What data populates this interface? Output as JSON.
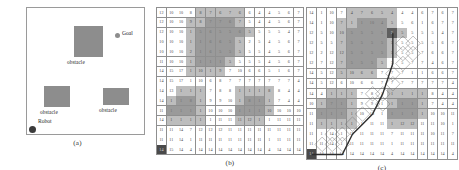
{
  "figure": {
    "panels": [
      {
        "id": "a",
        "caption": "(a)"
      },
      {
        "id": "b",
        "caption": "(b)"
      },
      {
        "id": "c",
        "caption": "(c)"
      }
    ]
  },
  "panel_a": {
    "obstacle_label": "obstacle",
    "goal_label": "Goal",
    "robot_label": "Robot",
    "obstacle_color": "#8d8d8d",
    "robot_color": "#3b3b3b",
    "border_color": "#9a9a9a",
    "obstacles": [
      {
        "name": "obstacle-top",
        "x": 47,
        "y": 18,
        "w": 29,
        "h": 31,
        "label": "obstacle",
        "label_x": 40,
        "label_y": 51
      },
      {
        "name": "obstacle-lower-left",
        "x": 17,
        "y": 78,
        "w": 26,
        "h": 21,
        "label": "obstacle",
        "label_x": 13,
        "label_y": 101
      },
      {
        "name": "obstacle-lower-left-notch",
        "x": 17,
        "y": 85,
        "w": 13,
        "h": 14,
        "label": "",
        "label_x": 0,
        "label_y": 0
      },
      {
        "name": "obstacle-right",
        "x": 76,
        "y": 80,
        "w": 26,
        "h": 17,
        "label": "obstacle",
        "label_x": 72,
        "label_y": 99
      }
    ],
    "goal": {
      "x": 88,
      "y": 25,
      "label_x": 95,
      "label_y": 22
    },
    "robot": {
      "x": 2,
      "y": 118,
      "label_x": 11,
      "label_y": 110
    }
  },
  "grid": {
    "rows": 15,
    "cols": 15,
    "cell_size_b": 9.3,
    "cell_size_c": 9.6,
    "colors": {
      "free": "#ffffff",
      "inflate": "#bdbdbd",
      "obstacle": "#9a9a9a",
      "start": "#4a4a4a",
      "goal": "#5f5f5f",
      "line": "#8f8f8f",
      "path": "#2e2e2e",
      "lattice": "#6d6d6d"
    },
    "start_cell": {
      "row": 14,
      "col": 0
    },
    "goal_cell": {
      "row": 2,
      "col": 8
    },
    "values": [
      [
        "12",
        "10",
        "10",
        "8",
        "8",
        "7",
        "6",
        "7",
        "6",
        "6",
        "4",
        "4",
        "5",
        "6",
        "7"
      ],
      [
        "12",
        "10",
        "10",
        "9",
        "8",
        "7",
        "7",
        "6",
        "7",
        "5",
        "4",
        "4",
        "5",
        "6",
        "7"
      ],
      [
        "12",
        "10",
        "10",
        "1",
        "5",
        "6",
        "5",
        "5",
        "6",
        "5",
        "5",
        "5",
        "5",
        "4",
        "7"
      ],
      [
        "10",
        "10",
        "10",
        "1",
        "1",
        "6",
        "6",
        "5",
        "5",
        "2",
        "5",
        "4",
        "5",
        "6",
        "7"
      ],
      [
        "10",
        "10",
        "10",
        "2",
        "1",
        "6",
        "5",
        "5",
        "5",
        "5",
        "5",
        "4",
        "5",
        "6",
        "7"
      ],
      [
        "11",
        "10",
        "10",
        "1",
        "1",
        "1",
        "1",
        "5",
        "5",
        "5",
        "5",
        "4",
        "5",
        "6",
        "7"
      ],
      [
        "14",
        "15",
        "17",
        "1",
        "10",
        "1",
        "9",
        "7",
        "10",
        "6",
        "6",
        "5",
        "1",
        "6",
        "7"
      ],
      [
        "14",
        "15",
        "17",
        "1",
        "10",
        "6",
        "8",
        "7",
        "7",
        "7",
        "7",
        "7",
        "7",
        "7",
        "4"
      ],
      [
        "14",
        "13",
        "1",
        "1",
        "1",
        "7",
        "8",
        "8",
        "1",
        "1",
        "1",
        "8",
        "8",
        "4",
        "4"
      ],
      [
        "14",
        "1",
        "1",
        "8",
        "1",
        "9",
        "9",
        "10",
        "1",
        "8",
        "1",
        "1",
        "7",
        "4",
        "4"
      ],
      [
        "11",
        "1",
        "1",
        "1",
        "1",
        "10",
        "10",
        "10",
        "1",
        "1",
        "1",
        "10",
        "10",
        "10",
        "10"
      ],
      [
        "14",
        "1",
        "1",
        "1",
        "1",
        "1",
        "11",
        "11",
        "11",
        "12",
        "1",
        "1",
        "11",
        "11",
        "11"
      ],
      [
        "11",
        "11",
        "14",
        "7",
        "12",
        "12",
        "12",
        "11",
        "11",
        "11",
        "11",
        "11",
        "11",
        "11",
        "11"
      ],
      [
        "11",
        "11",
        "14",
        "1",
        "11",
        "11",
        "11",
        "11",
        "11",
        "11",
        "11",
        "1",
        "11",
        "11",
        "11"
      ],
      [
        "14",
        "15",
        "14",
        "4",
        "14",
        "14",
        "14",
        "14",
        "14",
        "14",
        "14",
        "4",
        "14",
        "14",
        "14"
      ]
    ],
    "values_c": [
      [
        "14",
        "1",
        "10",
        "7",
        "4",
        "7",
        "6",
        "5",
        "4",
        "4",
        "4",
        "6",
        "7",
        "6",
        "7"
      ],
      [
        "14",
        "1",
        "10",
        "7",
        "1",
        "1",
        "10",
        "4",
        "5",
        "5",
        "6",
        "1",
        "6",
        "7",
        "7"
      ],
      [
        "12",
        "5",
        "10",
        "10",
        "5",
        "5",
        "5",
        "5",
        "5",
        "5",
        "5",
        "5",
        "5",
        "4",
        "7"
      ],
      [
        "12",
        "5",
        "5",
        "7",
        "5",
        "5",
        "5",
        "5",
        "5",
        "5",
        "5",
        "5",
        "5",
        "6",
        "7"
      ],
      [
        "12",
        "2",
        "12",
        "12",
        "5",
        "5",
        "5",
        "5",
        "5",
        "5",
        "5",
        "7",
        "6",
        "6",
        "7"
      ],
      [
        "12",
        "7",
        "12",
        "7",
        "5",
        "5",
        "5",
        "5",
        "5",
        "5",
        "7",
        "7",
        "4",
        "6",
        "7"
      ],
      [
        "14",
        "5",
        "12",
        "5",
        "10",
        "6",
        "6",
        "7",
        "7",
        "7",
        "1",
        "1",
        "6",
        "6",
        "7"
      ],
      [
        "14",
        "5",
        "12",
        "6",
        "10",
        "6",
        "6",
        "7",
        "7",
        "7",
        "7",
        "7",
        "7",
        "7",
        "4"
      ],
      [
        "14",
        "4",
        "1",
        "1",
        "1",
        "7",
        "8",
        "1",
        "1",
        "1",
        "1",
        "1",
        "8",
        "4",
        "4"
      ],
      [
        "10",
        "1",
        "7",
        "1",
        "1",
        "9",
        "9",
        "1",
        "1",
        "1",
        "1",
        "1",
        "7",
        "4",
        "4"
      ],
      [
        "11",
        "1",
        "1",
        "1",
        "1",
        "10",
        "10",
        "1",
        "1",
        "1",
        "1",
        "1",
        "10",
        "10",
        "11"
      ],
      [
        "11",
        "1",
        "1",
        "1",
        "1",
        "1",
        "11",
        "11",
        "1",
        "12",
        "12",
        "11",
        "11",
        "10",
        "1"
      ],
      [
        "11",
        "1",
        "14",
        "1",
        "12",
        "11",
        "11",
        "11",
        "7",
        "11",
        "11",
        "11",
        "10",
        "11",
        "7"
      ],
      [
        "11",
        "11",
        "14",
        "1",
        "11",
        "11",
        "11",
        "11",
        "1",
        "11",
        "11",
        "11",
        "11",
        "11",
        "11"
      ],
      [
        "14",
        "14",
        "14",
        "14",
        "14",
        "14",
        "14",
        "14",
        "4",
        "14",
        "14",
        "14",
        "14",
        "14",
        "4"
      ]
    ],
    "obstacle_cells": [
      [
        1,
        5
      ],
      [
        1,
        6
      ],
      [
        1,
        7
      ],
      [
        2,
        4
      ],
      [
        2,
        5
      ],
      [
        2,
        6
      ],
      [
        2,
        7
      ],
      [
        2,
        8
      ],
      [
        3,
        4
      ],
      [
        3,
        5
      ],
      [
        3,
        6
      ],
      [
        3,
        7
      ],
      [
        4,
        4
      ],
      [
        4,
        5
      ],
      [
        4,
        6
      ],
      [
        4,
        7
      ],
      [
        5,
        4
      ],
      [
        5,
        5
      ],
      [
        5,
        6
      ],
      [
        9,
        2
      ],
      [
        9,
        3
      ],
      [
        10,
        1
      ],
      [
        10,
        2
      ],
      [
        10,
        3
      ],
      [
        9,
        9
      ],
      [
        9,
        10
      ],
      [
        10,
        8
      ],
      [
        10,
        9
      ],
      [
        10,
        10
      ]
    ],
    "inflate_cells": [
      [
        0,
        4
      ],
      [
        0,
        5
      ],
      [
        0,
        6
      ],
      [
        0,
        7
      ],
      [
        0,
        8
      ],
      [
        1,
        3
      ],
      [
        1,
        4
      ],
      [
        1,
        8
      ],
      [
        2,
        3
      ],
      [
        2,
        9
      ],
      [
        3,
        3
      ],
      [
        3,
        8
      ],
      [
        4,
        3
      ],
      [
        4,
        7
      ],
      [
        4,
        8
      ],
      [
        5,
        3
      ],
      [
        5,
        7
      ],
      [
        6,
        3
      ],
      [
        6,
        4
      ],
      [
        6,
        5
      ],
      [
        6,
        6
      ],
      [
        8,
        2
      ],
      [
        8,
        3
      ],
      [
        8,
        4
      ],
      [
        8,
        8
      ],
      [
        8,
        9
      ],
      [
        8,
        10
      ],
      [
        8,
        11
      ],
      [
        9,
        1
      ],
      [
        9,
        4
      ],
      [
        9,
        8
      ],
      [
        9,
        11
      ],
      [
        10,
        4
      ],
      [
        10,
        11
      ],
      [
        11,
        1
      ],
      [
        11,
        2
      ],
      [
        11,
        3
      ],
      [
        11,
        4
      ],
      [
        11,
        8
      ],
      [
        11,
        9
      ],
      [
        11,
        10
      ]
    ]
  },
  "panel_c": {
    "path_points": [
      {
        "row": 14,
        "col": 0
      },
      {
        "row": 14,
        "col": 3
      },
      {
        "row": 12,
        "col": 4
      },
      {
        "row": 11,
        "col": 5
      },
      {
        "row": 10,
        "col": 6
      },
      {
        "row": 8,
        "col": 7
      },
      {
        "row": 5,
        "col": 8
      },
      {
        "row": 2,
        "col": 8
      }
    ],
    "lattice_nodes": [
      {
        "row": 13,
        "col": 1
      },
      {
        "row": 13,
        "col": 2
      },
      {
        "row": 13,
        "col": 3
      },
      {
        "row": 12,
        "col": 2
      },
      {
        "row": 12,
        "col": 3
      },
      {
        "row": 11,
        "col": 4
      },
      {
        "row": 10,
        "col": 5
      },
      {
        "row": 9,
        "col": 6
      },
      {
        "row": 9,
        "col": 7
      },
      {
        "row": 8,
        "col": 6
      },
      {
        "row": 8,
        "col": 7
      },
      {
        "row": 7,
        "col": 8
      },
      {
        "row": 6,
        "col": 8
      },
      {
        "row": 5,
        "col": 9
      },
      {
        "row": 4,
        "col": 9
      },
      {
        "row": 3,
        "col": 9
      },
      {
        "row": 3,
        "col": 10
      },
      {
        "row": 4,
        "col": 10
      }
    ]
  }
}
